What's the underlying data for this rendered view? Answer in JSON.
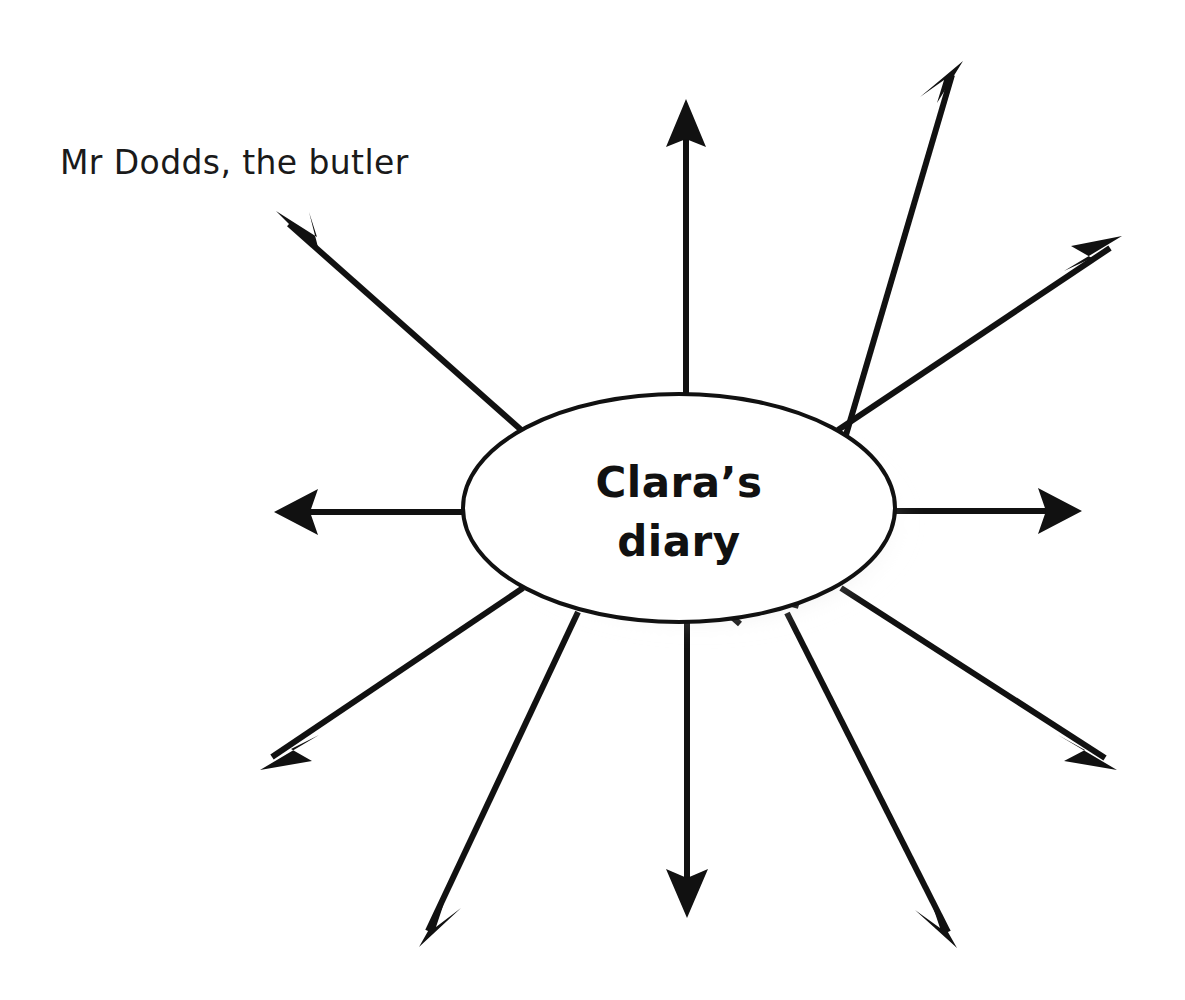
{
  "page": {
    "width": 1185,
    "height": 1000,
    "background_color": "#ffffff",
    "ink_color": "#111111",
    "type": "spider-diagram"
  },
  "centre": {
    "shape": "ellipse",
    "line_1": "Clara’s",
    "line_2": "diary",
    "full_text": "Clara’s diary",
    "cx": 679,
    "cy": 508,
    "rx": 216,
    "ry": 114,
    "fill": "#ffffff",
    "stroke": "#111111",
    "has_drop_shadow": true,
    "shadow_color": "#9a9a9a"
  },
  "annotation": {
    "label": "Mr Dodds, the butler",
    "x": 62,
    "y": 172,
    "color": "#1a1a1a",
    "attached_to_branch": 1
  },
  "branches": {
    "count": 11,
    "style": "straight line with solid triangular arrowhead pointing outward",
    "stroke_width": 6,
    "items": [
      {
        "id": 1,
        "name": "branch-upper-left",
        "angle_deg": 217,
        "tip_x": 276,
        "tip_y": 211,
        "labelled": true,
        "label": "Mr Dodds, the butler"
      },
      {
        "id": 2,
        "name": "branch-up",
        "angle_deg": 270,
        "tip_x": 686,
        "tip_y": 99,
        "labelled": false,
        "label": ""
      },
      {
        "id": 3,
        "name": "branch-upper-right-steep",
        "angle_deg": 300,
        "tip_x": 963,
        "tip_y": 61,
        "labelled": false,
        "label": ""
      },
      {
        "id": 4,
        "name": "branch-upper-right-shallow",
        "angle_deg": 330,
        "tip_x": 1122,
        "tip_y": 236,
        "labelled": false,
        "label": ""
      },
      {
        "id": 5,
        "name": "branch-right",
        "angle_deg": 0,
        "tip_x": 1082,
        "tip_y": 511,
        "labelled": false,
        "label": ""
      },
      {
        "id": 6,
        "name": "branch-lower-right-shallow",
        "angle_deg": 30,
        "tip_x": 1117,
        "tip_y": 770,
        "labelled": false,
        "label": ""
      },
      {
        "id": 7,
        "name": "branch-lower-right-steep",
        "angle_deg": 60,
        "tip_x": 957,
        "tip_y": 948,
        "labelled": false,
        "label": ""
      },
      {
        "id": 8,
        "name": "branch-down",
        "angle_deg": 90,
        "tip_x": 687,
        "tip_y": 918,
        "labelled": false,
        "label": ""
      },
      {
        "id": 9,
        "name": "branch-lower-left-steep",
        "angle_deg": 120,
        "tip_x": 419,
        "tip_y": 947,
        "labelled": false,
        "label": ""
      },
      {
        "id": 10,
        "name": "branch-lower-left-shallow",
        "angle_deg": 150,
        "tip_x": 260,
        "tip_y": 770,
        "labelled": false,
        "label": ""
      },
      {
        "id": 11,
        "name": "branch-left",
        "angle_deg": 180,
        "tip_x": 274,
        "tip_y": 512,
        "labelled": false,
        "label": ""
      }
    ]
  }
}
